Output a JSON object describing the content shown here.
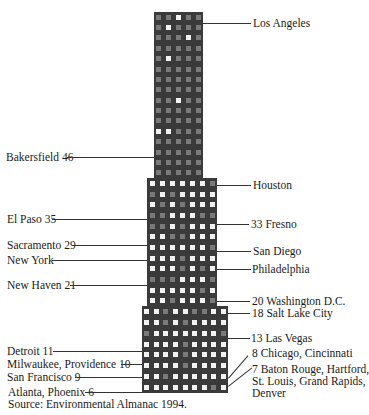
{
  "chart_data": {
    "type": "pictograph",
    "title": "",
    "source": "Source: Environmental Almanac 1994.",
    "building": {
      "tiers": [
        {
          "name": "top",
          "x": 154,
          "y": 12,
          "w": 49,
          "h": 166,
          "cols": 5,
          "rows": 16
        },
        {
          "name": "middle",
          "x": 147,
          "y": 178,
          "w": 70,
          "h": 128,
          "cols": 7,
          "rows": 12
        },
        {
          "name": "bottom",
          "x": 142,
          "y": 306,
          "w": 86,
          "h": 87,
          "cols": 9,
          "rows": 8
        }
      ],
      "colors": {
        "body": "#3a3a3a",
        "window_lit": "#f2f2f2",
        "window_dim": "#7a7a7a"
      }
    },
    "entries": [
      {
        "city": "Los Angeles",
        "value": null,
        "side": "right"
      },
      {
        "city": "Bakersfield",
        "value": 46,
        "side": "left"
      },
      {
        "city": "Houston",
        "value": null,
        "side": "right"
      },
      {
        "city": "El Paso",
        "value": 35,
        "side": "left"
      },
      {
        "city": "Fresno",
        "value": 33,
        "side": "right"
      },
      {
        "city": "Sacramento",
        "value": 29,
        "side": "left"
      },
      {
        "city": "San Diego",
        "value": null,
        "side": "right"
      },
      {
        "city": "New York",
        "value": null,
        "side": "left"
      },
      {
        "city": "Philadelphia",
        "value": null,
        "side": "right"
      },
      {
        "city": "New Haven",
        "value": 21,
        "side": "left"
      },
      {
        "city": "Washington D.C.",
        "value": 20,
        "side": "right"
      },
      {
        "city": "Salt Lake City",
        "value": 18,
        "side": "right"
      },
      {
        "city": "Las Vegas",
        "value": 13,
        "side": "right"
      },
      {
        "city": "Detroit",
        "value": 11,
        "side": "left"
      },
      {
        "city": "Milwaukee, Providence",
        "value": 10,
        "side": "left"
      },
      {
        "city": "Chicago, Cincinnati",
        "value": 8,
        "side": "right"
      },
      {
        "city": "San Francisco",
        "value": 9,
        "side": "left"
      },
      {
        "city": "Baton Rouge, Hartford, St. Louis, Grand Rapids, Denver",
        "value": 7,
        "side": "right"
      },
      {
        "city": "Atlanta, Phoenix",
        "value": 6,
        "side": "left"
      }
    ]
  },
  "labels": {
    "los_angeles": "Los Angeles",
    "bakersfield": "Bakersfield 46",
    "houston": "Houston",
    "el_paso": "El Paso 35",
    "fresno": "33 Fresno",
    "sacramento": "Sacramento 29",
    "san_diego": "San Diego",
    "new_york": "New York",
    "philadelphia": "Philadelphia",
    "new_haven": "New Haven 21",
    "washington": "20 Washington D.C.",
    "salt_lake": "18 Salt Lake City",
    "las_vegas": "13 Las Vegas",
    "detroit": "Detroit 11",
    "milwaukee": "Milwaukee, Providence 10",
    "chicago": "8 Chicago, Cincinnati",
    "san_francisco": "San Francisco 9",
    "baton_rouge_1": "7 Baton Rouge, Hartford,",
    "baton_rouge_2": "St. Louis, Grand Rapids,",
    "baton_rouge_3": "Denver",
    "atlanta": "Atlanta, Phoenix 6"
  },
  "source": "Source: Environmental Almanac 1994."
}
